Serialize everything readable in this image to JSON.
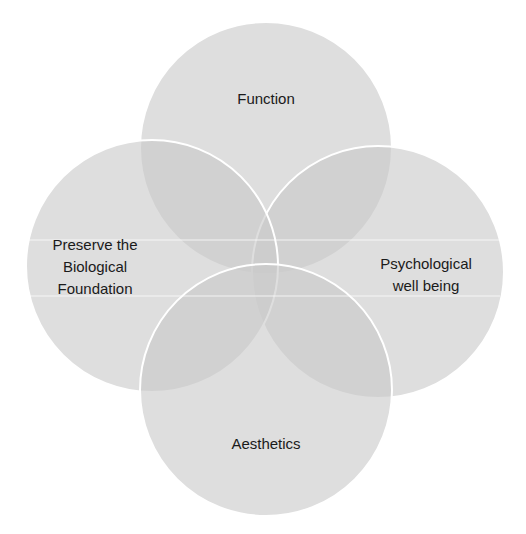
{
  "diagram": {
    "type": "four-circle overlapping venn",
    "colors": {
      "circle_fill": "#c9c9c9",
      "circle_stroke": "#ffffff",
      "text": "#1a1a1a",
      "background": "#ffffff"
    },
    "circles": [
      {
        "id": "function",
        "label": "Function",
        "position": "top"
      },
      {
        "id": "biological",
        "label": "Preserve the\nBiological\nFoundation",
        "position": "left"
      },
      {
        "id": "psychological",
        "label": "Psychological\nwell being",
        "position": "right"
      },
      {
        "id": "aesthetics",
        "label": "Aesthetics",
        "position": "bottom"
      }
    ]
  }
}
